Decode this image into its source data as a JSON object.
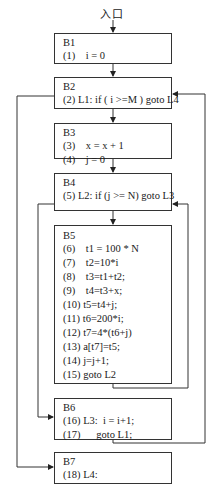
{
  "entry": {
    "label": "入口"
  },
  "blocks": [
    {
      "id": "B1",
      "lines": [
        {
          "num": "(1)",
          "code": "    i = 0"
        }
      ]
    },
    {
      "id": "B2",
      "lines": [
        {
          "num": "(2)",
          "code": " L1: if ( i >=M ) goto L4"
        }
      ]
    },
    {
      "id": "B3",
      "lines": [
        {
          "num": "(3)",
          "code": "    x = x + 1"
        },
        {
          "num": "(4)",
          "code": "    j = 0"
        }
      ]
    },
    {
      "id": "B4",
      "lines": [
        {
          "num": "(5)",
          "code": " L2: if (j >= N) goto L3"
        }
      ]
    },
    {
      "id": "B5",
      "lines": [
        {
          "num": "(6)",
          "code": "    t1 = 100 * N"
        },
        {
          "num": "(7)",
          "code": "    t2=10*i"
        },
        {
          "num": "(8)",
          "code": "    t3=t1+t2;"
        },
        {
          "num": "(9)",
          "code": "    t4=t3+x;"
        },
        {
          "num": "(10)",
          "code": " t5=t4+j;"
        },
        {
          "num": "(11)",
          "code": " t6=200*i;"
        },
        {
          "num": "(12)",
          "code": " t7=4*(t6+j)"
        },
        {
          "num": "(13)",
          "code": " a[t7]=t5;"
        },
        {
          "num": "(14)",
          "code": " j=j+1;"
        },
        {
          "num": "(15)",
          "code": " goto L2"
        }
      ]
    },
    {
      "id": "B6",
      "lines": [
        {
          "num": "(16)",
          "code": " L3:  i = i+1;"
        },
        {
          "num": "(17)",
          "code": "      goto L1;"
        }
      ]
    },
    {
      "id": "B7",
      "lines": [
        {
          "num": "(18)",
          "code": " L4:"
        }
      ]
    }
  ],
  "edges": [
    {
      "from": "entry",
      "to": "B1"
    },
    {
      "from": "B1",
      "to": "B2"
    },
    {
      "from": "B2",
      "to": "B3"
    },
    {
      "from": "B2",
      "to": "B7",
      "label": "L4"
    },
    {
      "from": "B3",
      "to": "B4"
    },
    {
      "from": "B4",
      "to": "B5"
    },
    {
      "from": "B4",
      "to": "B6",
      "label": "L3"
    },
    {
      "from": "B5",
      "to": "B4",
      "label": "goto L2"
    },
    {
      "from": "B6",
      "to": "B2",
      "label": "goto L1"
    }
  ]
}
